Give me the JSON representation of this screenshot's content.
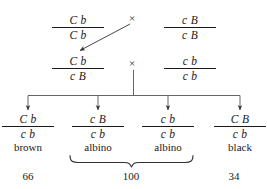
{
  "diagram": {
    "cross_symbol": "×",
    "ink_color": "#1a1a1a",
    "parents": {
      "p1_left": {
        "numerator": "C b",
        "denominator": "C b"
      },
      "p1_right": {
        "numerator": "c B",
        "denominator": "c B"
      }
    },
    "f1": {
      "f1_left": {
        "numerator": "C b",
        "denominator": "c B"
      },
      "tester_right": {
        "numerator": "c b",
        "denominator": "c b"
      }
    },
    "offspring": [
      {
        "numerator": "C b",
        "denominator": "c b",
        "phenotype": "brown",
        "count": "66"
      },
      {
        "numerator": "c B",
        "denominator": "c b",
        "phenotype": "albino",
        "count": ""
      },
      {
        "numerator": "c b",
        "denominator": "c b",
        "phenotype": "albino",
        "count": ""
      },
      {
        "numerator": "C B",
        "denominator": "c b",
        "phenotype": "black",
        "count": "34"
      }
    ],
    "grouped_count": "100",
    "counts_row": [
      "66",
      "100",
      "34"
    ]
  }
}
